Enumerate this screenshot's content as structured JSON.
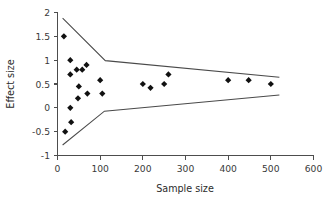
{
  "chart_data": {
    "type": "scatter",
    "title": "",
    "xlabel": "Sample size",
    "ylabel": "Effect size",
    "xlim": [
      0,
      600
    ],
    "ylim": [
      -1,
      2
    ],
    "xticks": [
      0,
      100,
      200,
      300,
      400,
      500,
      600
    ],
    "xtick_labels": [
      "0",
      "100",
      "200",
      "300",
      "400",
      "500",
      "600"
    ],
    "yticks": [
      -1,
      -0.5,
      0,
      0.5,
      1,
      1.5,
      2
    ],
    "ytick_labels": [
      "-1",
      "-0.5",
      "0",
      "0.5",
      "1",
      "1.5",
      "2"
    ],
    "grid": false,
    "legend": false,
    "marker": "diamond",
    "marker_color": "#111111",
    "series": [
      {
        "name": "studies",
        "points": [
          {
            "x": 15,
            "y": 1.5
          },
          {
            "x": 18,
            "y": -0.5
          },
          {
            "x": 30,
            "y": 1.0
          },
          {
            "x": 30,
            "y": 0.7
          },
          {
            "x": 30,
            "y": 0.0
          },
          {
            "x": 32,
            "y": -0.3
          },
          {
            "x": 45,
            "y": 0.8
          },
          {
            "x": 48,
            "y": 0.2
          },
          {
            "x": 50,
            "y": 0.45
          },
          {
            "x": 58,
            "y": 0.8
          },
          {
            "x": 68,
            "y": 0.9
          },
          {
            "x": 70,
            "y": 0.3
          },
          {
            "x": 100,
            "y": 0.58
          },
          {
            "x": 105,
            "y": 0.3
          },
          {
            "x": 200,
            "y": 0.5
          },
          {
            "x": 218,
            "y": 0.42
          },
          {
            "x": 250,
            "y": 0.5
          },
          {
            "x": 260,
            "y": 0.7
          },
          {
            "x": 400,
            "y": 0.58
          },
          {
            "x": 448,
            "y": 0.58
          },
          {
            "x": 500,
            "y": 0.5
          }
        ]
      }
    ],
    "funnel": {
      "description": "pseudo confidence interval funnel boundaries",
      "upper": [
        {
          "x": 12,
          "y": 1.88
        },
        {
          "x": 112,
          "y": 0.99
        },
        {
          "x": 520,
          "y": 0.64
        }
      ],
      "lower": [
        {
          "x": 12,
          "y": -0.78
        },
        {
          "x": 110,
          "y": -0.07
        },
        {
          "x": 520,
          "y": 0.27
        }
      ]
    }
  }
}
